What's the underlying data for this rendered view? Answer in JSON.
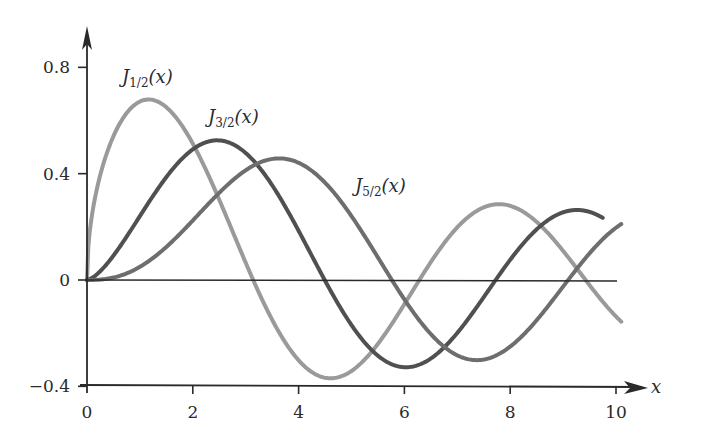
{
  "chart_data": {
    "type": "line",
    "title": "",
    "xlabel": "x",
    "ylabel": "",
    "xlim": [
      0,
      10
    ],
    "ylim": [
      -0.4,
      0.8
    ],
    "grid": false,
    "legend": "inline labels",
    "x_ticks": [
      "0",
      "2",
      "4",
      "6",
      "8",
      "10"
    ],
    "y_ticks": [
      "−0.4",
      "0",
      "0.4",
      "0.8"
    ],
    "x_tick_values": [
      0,
      2,
      4,
      6,
      8,
      10
    ],
    "y_tick_values": [
      -0.4,
      0,
      0.4,
      0.8
    ],
    "series": [
      {
        "name": "J_{1/2}(x)",
        "label_main": "J",
        "label_sub": "1/2",
        "label_arg": "(x)",
        "order": 0.5,
        "color": "#9a9a9a",
        "x": [
          0,
          0.5,
          1,
          1.2,
          1.5,
          2,
          2.5,
          3,
          3.5,
          4,
          4.5,
          5,
          5.5,
          6,
          6.5,
          7,
          7.5,
          8,
          8.5,
          9,
          9.5,
          10
        ],
        "values": [
          0,
          0.541,
          0.671,
          0.678,
          0.65,
          0.513,
          0.304,
          0.089,
          -0.15,
          -0.342,
          -0.42,
          -0.342,
          -0.238,
          -0.091,
          0.067,
          0.198,
          0.273,
          0.28,
          0.218,
          0.116,
          -0.018,
          -0.137
        ]
      },
      {
        "name": "J_{3/2}(x)",
        "label_main": "J",
        "label_sub": "3/2",
        "label_arg": "(x)",
        "order": 1.5,
        "color": "#505050",
        "x": [
          0,
          0.5,
          1,
          1.5,
          2,
          2.5,
          3,
          3.5,
          4,
          4.5,
          5,
          5.5,
          6,
          6.5,
          7,
          7.5,
          8,
          8.5,
          9,
          9.5,
          9.7
        ],
        "values": [
          0,
          0.092,
          0.24,
          0.387,
          0.491,
          0.521,
          0.477,
          0.35,
          0.16,
          -0.038,
          -0.17,
          -0.271,
          -0.32,
          -0.276,
          -0.17,
          -0.012,
          0.136,
          0.232,
          0.262,
          0.246,
          0.226
        ]
      },
      {
        "name": "J_{5/2}(x)",
        "label_main": "J",
        "label_sub": "5/2",
        "label_arg": "(x)",
        "order": 2.5,
        "color": "#6e6e6e",
        "x": [
          0,
          0.5,
          1,
          1.5,
          2,
          2.5,
          3,
          3.5,
          4,
          4.5,
          5,
          5.5,
          6,
          6.5,
          7,
          7.5,
          8,
          8.5,
          9,
          9.5,
          10
        ],
        "values": [
          0,
          0.009,
          0.05,
          0.126,
          0.223,
          0.321,
          0.4,
          0.444,
          0.44,
          0.381,
          0.274,
          0.134,
          -0.02,
          -0.161,
          -0.272,
          -0.312,
          -0.284,
          -0.191,
          -0.054,
          0.091,
          0.198
        ]
      }
    ]
  }
}
